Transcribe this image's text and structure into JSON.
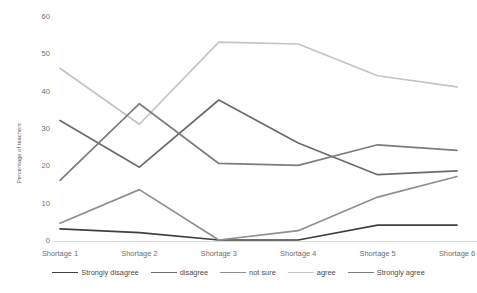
{
  "chart_data": {
    "type": "line",
    "title": "",
    "xlabel": "",
    "ylabel": "Percentage of teachers",
    "categories": [
      "Shortage 1",
      "Shortage 2",
      "Shortage 3",
      "Shortage 4",
      "Shortage 5",
      "Shortage 6"
    ],
    "ylim": [
      0,
      60
    ],
    "yticks": [
      0,
      10,
      20,
      30,
      40,
      50,
      60
    ],
    "grid": false,
    "legend_position": "bottom",
    "series": [
      {
        "name": "Strongly disagree",
        "color": "#404040",
        "values": [
          3,
          2,
          0,
          0,
          4,
          4
        ]
      },
      {
        "name": "disagree",
        "color": "#6b6b6b",
        "values": [
          32,
          19.5,
          37.5,
          26,
          17.5,
          18.5
        ]
      },
      {
        "name": "not sure",
        "color": "#8f8f8f",
        "values": [
          4.5,
          13.5,
          0,
          2.5,
          11.5,
          17
        ]
      },
      {
        "name": "agree",
        "color": "#c4c4c4",
        "values": [
          46,
          31,
          53,
          52.5,
          44,
          41
        ]
      },
      {
        "name": "Strongly agree",
        "color": "#7d7d7d",
        "values": [
          16,
          36.5,
          20.5,
          20,
          25.5,
          24
        ]
      }
    ]
  },
  "axis": {
    "axis_line_color": "#d9d9d9"
  }
}
